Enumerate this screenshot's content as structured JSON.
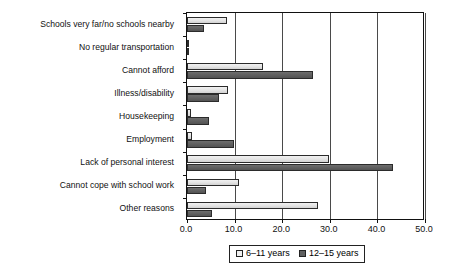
{
  "chart_data": {
    "type": "bar",
    "orientation": "horizontal",
    "title": "",
    "xlabel": "",
    "ylabel": "",
    "xlim": [
      0.0,
      50.0
    ],
    "xticks": [
      "0.0",
      "10.0",
      "20.0",
      "30.0",
      "40.0",
      "50.0"
    ],
    "xtick_values": [
      0.0,
      10.0,
      20.0,
      30.0,
      40.0,
      50.0
    ],
    "grid": true,
    "grid_axis": "x",
    "legend_position": "bottom-center",
    "categories": [
      "Schools very far/no schools nearby",
      "No regular transportation",
      "Cannot afford",
      "Illness/disability",
      "Housekeeping",
      "Employment",
      "Lack of personal interest",
      "Cannot cope with school work",
      "Other reasons"
    ],
    "series": [
      {
        "name": "6–11 years",
        "color": "#e6e6e6",
        "values": [
          8.4,
          0.5,
          16.0,
          8.6,
          0.8,
          1.0,
          29.8,
          10.9,
          27.5
        ]
      },
      {
        "name": "12–15 years",
        "color": "#5f5f5f",
        "values": [
          3.6,
          0.4,
          26.5,
          6.7,
          4.6,
          9.9,
          43.2,
          4.0,
          5.2
        ]
      }
    ]
  },
  "legend": {
    "items": [
      {
        "label": "6–11 years"
      },
      {
        "label": "12–15 years"
      }
    ]
  }
}
